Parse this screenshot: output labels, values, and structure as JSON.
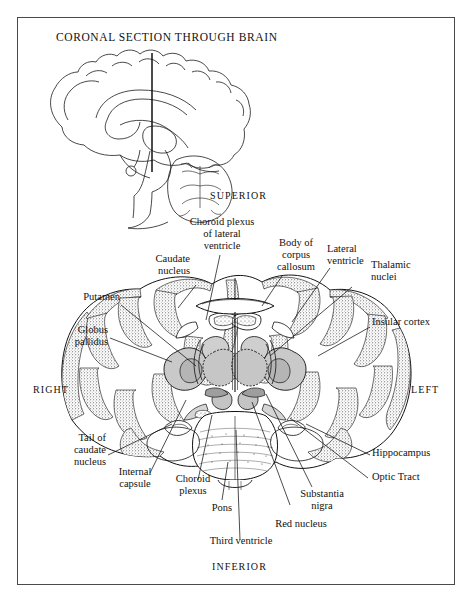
{
  "figure": {
    "title": "CORONAL SECTION THROUGH BRAIN",
    "orientation": {
      "superior": "SUPERIOR",
      "inferior": "INFERIOR",
      "left": "LEFT",
      "right": "RIGHT"
    },
    "inset_caption": "",
    "labels": {
      "choroid_plexus_lateral": "Choroid plexus\nof lateral\nventricle",
      "body_corpus_callosum": "Body of\ncorpus\ncallosum",
      "caudate_nucleus": "Caudate\nnucleus",
      "lateral_ventricle": "Lateral\nventricle",
      "thalamic_nuclei": "Thalamic\nnuclei",
      "putamen": "Putamen",
      "insular_cortex": "Insular cortex",
      "globus_pallidus": "Globus\npallidus",
      "tail_caudate_nucleus": "Tail of\ncaudate\nnucleus",
      "hippocampus": "Hippocampus",
      "optic_tract": "Optic Tract",
      "internal_capsule": "Internal\ncapsule",
      "choroid_plexus": "Choroid\nplexus",
      "pons": "Pons",
      "third_ventricle": "Third ventricle",
      "red_nucleus": "Red nucleus",
      "substantia_nigra": "Substantia\nnigra"
    }
  },
  "colors": {
    "ink": "#111111",
    "frame": "#4a4a4a",
    "page": "#ffffff",
    "gray_matter_shade": "#c9c9c9",
    "stipple": "#3a3a3a"
  }
}
